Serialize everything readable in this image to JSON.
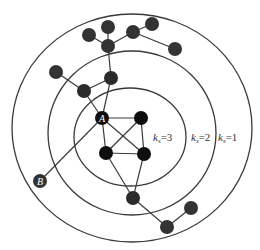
{
  "diagram": {
    "type": "k-shell decomposition",
    "rings": [
      {
        "id": "ring-ks1",
        "cx": 132,
        "cy": 128,
        "rx": 120,
        "ry": 114
      },
      {
        "id": "ring-ks2",
        "cx": 132,
        "cy": 133,
        "rx": 84,
        "ry": 82
      },
      {
        "id": "ring-ks3",
        "cx": 130,
        "cy": 137,
        "rx": 56,
        "ry": 49
      }
    ],
    "shell_labels": [
      {
        "k": "k",
        "sub": "s",
        "eq": "=3",
        "x": 153,
        "y": 141
      },
      {
        "k": "k",
        "sub": "s",
        "eq": "=2",
        "x": 191,
        "y": 141
      },
      {
        "k": "k",
        "sub": "s",
        "eq": "=1",
        "x": 218,
        "y": 141
      }
    ],
    "nodes": [
      {
        "id": "A",
        "label": "A",
        "x": 102,
        "y": 118,
        "shell": 3
      },
      {
        "id": "n2",
        "label": "",
        "x": 141,
        "y": 118,
        "shell": 3
      },
      {
        "id": "n3",
        "label": "",
        "x": 106,
        "y": 153,
        "shell": 3
      },
      {
        "id": "n4",
        "label": "",
        "x": 144,
        "y": 154,
        "shell": 3
      },
      {
        "id": "n5",
        "label": "",
        "x": 111,
        "y": 78,
        "shell": 2
      },
      {
        "id": "n6",
        "label": "",
        "x": 84,
        "y": 91,
        "shell": 2
      },
      {
        "id": "n7",
        "label": "",
        "x": 133,
        "y": 198,
        "shell": 2
      },
      {
        "id": "n8",
        "label": "",
        "x": 108,
        "y": 46,
        "shell": 1
      },
      {
        "id": "n9",
        "label": "",
        "x": 89,
        "y": 35,
        "shell": 1
      },
      {
        "id": "n10",
        "label": "",
        "x": 108,
        "y": 27,
        "shell": 1
      },
      {
        "id": "n11",
        "label": "",
        "x": 133,
        "y": 32,
        "shell": 1
      },
      {
        "id": "n12",
        "label": "",
        "x": 152,
        "y": 24,
        "shell": 1
      },
      {
        "id": "n13",
        "label": "",
        "x": 175,
        "y": 49,
        "shell": 1
      },
      {
        "id": "n14",
        "label": "",
        "x": 56,
        "y": 72,
        "shell": 1
      },
      {
        "id": "B",
        "label": "B",
        "x": 40,
        "y": 181,
        "shell": 1
      },
      {
        "id": "n16",
        "label": "",
        "x": 167,
        "y": 227,
        "shell": 1
      },
      {
        "id": "n17",
        "label": "",
        "x": 191,
        "y": 208,
        "shell": 1
      }
    ],
    "edges": [
      [
        "A",
        "n2"
      ],
      [
        "A",
        "n3"
      ],
      [
        "A",
        "n4"
      ],
      [
        "n2",
        "n3"
      ],
      [
        "n2",
        "n4"
      ],
      [
        "n3",
        "n4"
      ],
      [
        "A",
        "n5"
      ],
      [
        "A",
        "n6"
      ],
      [
        "n5",
        "n6"
      ],
      [
        "n5",
        "n8"
      ],
      [
        "n8",
        "n9"
      ],
      [
        "n8",
        "n10"
      ],
      [
        "n8",
        "n11"
      ],
      [
        "n11",
        "n12"
      ],
      [
        "n11",
        "n13"
      ],
      [
        "n6",
        "n14"
      ],
      [
        "A",
        "B"
      ],
      [
        "n3",
        "n7"
      ],
      [
        "n4",
        "n7"
      ],
      [
        "n7",
        "n16"
      ],
      [
        "n16",
        "n17"
      ]
    ]
  }
}
